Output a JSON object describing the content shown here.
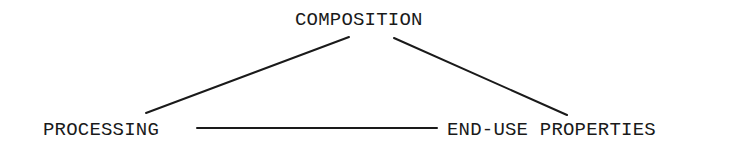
{
  "diagram": {
    "type": "triangle-relationship",
    "nodes": [
      {
        "id": "composition",
        "label": "COMPOSITION"
      },
      {
        "id": "processing",
        "label": "PROCESSING"
      },
      {
        "id": "end_use_properties",
        "label": "END-USE PROPERTIES"
      }
    ],
    "edges": [
      {
        "from": "composition",
        "to": "processing"
      },
      {
        "from": "composition",
        "to": "end_use_properties"
      },
      {
        "from": "processing",
        "to": "end_use_properties"
      }
    ],
    "colors": {
      "line": "#1a1a1a",
      "text": "#1a1a1a",
      "background": "#ffffff"
    }
  }
}
